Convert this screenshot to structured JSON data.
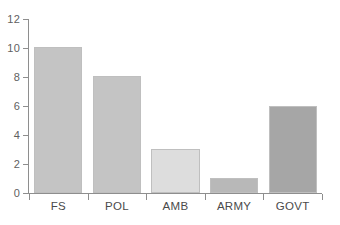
{
  "chart_data": {
    "type": "bar",
    "title": "",
    "subtitle": "",
    "xlabel": "",
    "ylabel": "",
    "categories": [
      "FS",
      "POL",
      "AMB",
      "ARMY",
      "GOVT"
    ],
    "values": [
      10.1,
      8.05,
      3.05,
      1.05,
      6.0
    ],
    "bar_colors": [
      "#c4c4c4",
      "#c4c4c4",
      "#dddddd",
      "#b8b8b8",
      "#a6a6a6"
    ],
    "bar_border_color": "#bfbfbf",
    "ylim": [
      0,
      12
    ],
    "ytick_values": [
      0,
      2,
      4,
      6,
      8,
      10,
      12
    ],
    "ytick_labels": [
      "0",
      "2",
      "4",
      "6",
      "8",
      "10",
      "12"
    ],
    "grid": false,
    "legend": false,
    "legend_position": "none",
    "axis_color": "#8e8e8e",
    "tick_label_color": "#5f5f5f",
    "category_label_color": "#4a4a4a",
    "background_color": "#ffffff"
  }
}
